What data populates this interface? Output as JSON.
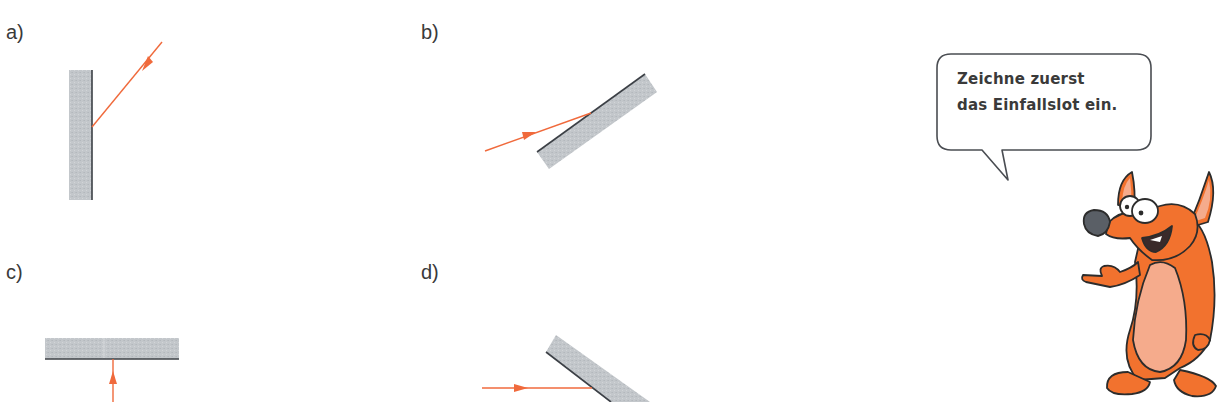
{
  "exercises": [
    {
      "label": "a)",
      "id": "a"
    },
    {
      "label": "b)",
      "id": "b"
    },
    {
      "label": "c)",
      "id": "c"
    },
    {
      "label": "d)",
      "id": "d"
    }
  ],
  "speech_bubble": {
    "line1": "Zeichne zuerst",
    "line2": "das Einfallslot ein."
  },
  "colors": {
    "mirror_fill": "#c4c8cc",
    "mirror_edge": "#3c4046",
    "ray": "#f06a3c",
    "text": "#3a3a3a",
    "character_orange": "#f2722e",
    "character_belly": "#f5ab8c",
    "character_nose": "#5a5f66"
  }
}
